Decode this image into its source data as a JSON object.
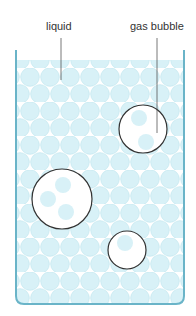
{
  "labels": {
    "liquid": "liquid",
    "gas_bubble": "gas bubble"
  },
  "colors": {
    "container": "#6ab4c8",
    "particle_fill": "#d8f1f7",
    "particle_stroke": "#c2e6ef",
    "bubble_stroke": "#333333",
    "leader_line": "#555555"
  }
}
